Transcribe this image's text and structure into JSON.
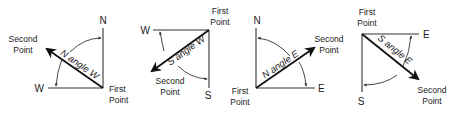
{
  "diagrams": [
    {
      "id": "n-angle-w",
      "angle_label": "N angle W",
      "axis_a": "N",
      "axis_b": "W",
      "first_point": [
        "First",
        "Point"
      ],
      "second_point": [
        "Second",
        "Point"
      ]
    },
    {
      "id": "s-angle-w",
      "angle_label": "S angle W",
      "axis_a": "W",
      "axis_b": "S",
      "first_point": [
        "First",
        "Point"
      ],
      "second_point": [
        "Second",
        "Point"
      ]
    },
    {
      "id": "n-angle-e",
      "angle_label": "N angle E",
      "axis_a": "N",
      "axis_b": "E",
      "first_point": [
        "First",
        "Point"
      ],
      "second_point": [
        "Second",
        "Point"
      ]
    },
    {
      "id": "s-angle-e",
      "angle_label": "S angle E",
      "axis_a": "E",
      "axis_b": "S",
      "first_point": [
        "First",
        "Point"
      ],
      "second_point": [
        "Second",
        "Point"
      ]
    }
  ],
  "colors": {
    "line": "#333333",
    "vector": "#111111",
    "background": "#ffffff"
  }
}
